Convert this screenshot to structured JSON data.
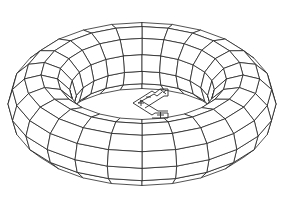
{
  "drawing": {
    "type": "wireframe-torus",
    "stroke_color": "#1a1a1a",
    "background": "#ffffff",
    "torus": {
      "center_x": 142,
      "center_y": 104,
      "major_radius_px": 101,
      "minor_radius_px": 33,
      "tilt_factor": 0.48,
      "major_segments": 24,
      "minor_segments": 12
    },
    "ucs_icon": {
      "name": "ucs-icon",
      "x": 133,
      "y": 88,
      "width": 36,
      "height": 30,
      "labels": [
        "X",
        "Y"
      ]
    }
  }
}
